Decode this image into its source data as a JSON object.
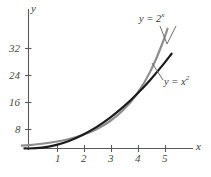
{
  "chart_data": {
    "type": "line",
    "title": "",
    "xlabel": "x",
    "ylabel": "y",
    "xlim": [
      -0.25,
      6.1
    ],
    "ylim": [
      -1.5,
      36
    ],
    "grid": false,
    "legend_position": "inline-annotations",
    "xticks": [
      1,
      2,
      3,
      4,
      5
    ],
    "xtick_labels": [
      "1",
      "2",
      "3",
      "4",
      "5"
    ],
    "yticks": [
      8,
      16,
      24,
      32
    ],
    "ytick_labels": [
      "8",
      "16",
      "24",
      "32"
    ],
    "series": [
      {
        "name": "y = 2^x",
        "label_text": "y = 2",
        "label_exponent": "x",
        "color": "#8e8e8e",
        "x": [
          -0.25,
          0,
          0.5,
          1,
          1.5,
          2,
          2.5,
          3,
          3.5,
          4,
          4.5,
          5,
          5.15
        ],
        "values": [
          0.84,
          1,
          1.41,
          2,
          2.83,
          4,
          5.66,
          8,
          11.31,
          16,
          22.63,
          32,
          35.5
        ]
      },
      {
        "name": "y = x^2",
        "label_text": "y = x",
        "label_exponent": "2",
        "color": "#1c1c1c",
        "x": [
          -0.15,
          0,
          0.5,
          1,
          1.5,
          2,
          2.5,
          3,
          3.5,
          4,
          4.5,
          5,
          5.3
        ],
        "values": [
          0.02,
          0,
          0.25,
          1,
          2.25,
          4,
          6.25,
          9,
          12.25,
          16,
          20.25,
          25,
          28.09
        ]
      }
    ],
    "annotations": [
      {
        "name": "exp-curve-label",
        "text": "y = 2",
        "exponent": "x"
      },
      {
        "name": "quadratic-curve-label",
        "text": "y = x",
        "exponent": "2"
      }
    ]
  },
  "axes": {
    "y_axis_label": "y",
    "x_axis_label": "x",
    "axis_color": "#5a5a5a"
  }
}
